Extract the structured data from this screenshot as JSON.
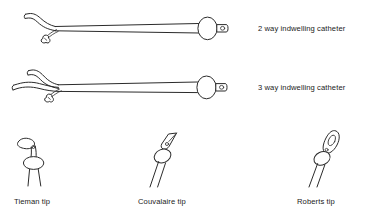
{
  "figure": {
    "background_color": "#ffffff",
    "line_color": "#2b2b2b",
    "text_color": "#1a1a1a"
  },
  "catheters": [
    {
      "id": "two-way",
      "label": "2 way indwelling catheter",
      "ports": 2,
      "has_balloon": true,
      "has_inflation_valve": true
    },
    {
      "id": "three-way",
      "label": "3 way indwelling catheter",
      "ports": 3,
      "has_balloon": true,
      "has_inflation_valve": true
    }
  ],
  "tips": [
    {
      "id": "tieman",
      "label": "Tieman tip"
    },
    {
      "id": "couvalaire",
      "label": "Couvalaire tip"
    },
    {
      "id": "roberts",
      "label": "Roberts tip"
    }
  ]
}
